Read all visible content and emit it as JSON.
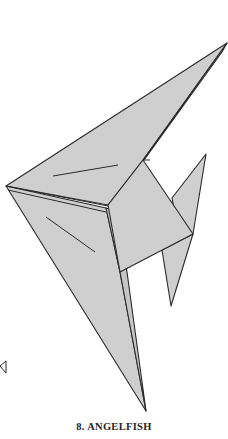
{
  "figure": {
    "caption": "8. ANGELFISH",
    "step_number": "8",
    "title": "ANGELFISH",
    "colors": {
      "paper": "#cfcfcf",
      "outline": "#2a2a2a",
      "background": "#ffffff"
    },
    "icons": [
      "arrow-marker-icon"
    ]
  }
}
